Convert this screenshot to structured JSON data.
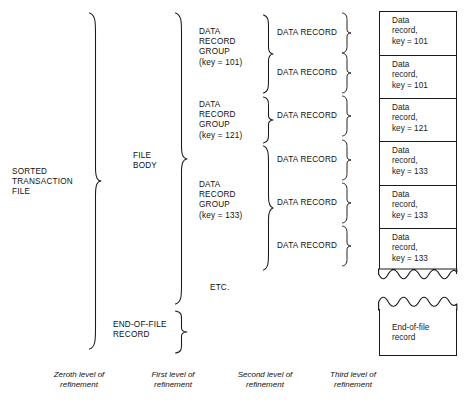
{
  "diagram": {
    "levels": [
      {
        "id": "level0",
        "label": "Zeroth level of\nrefinement"
      },
      {
        "id": "level1",
        "label": "First level of\nrefinement"
      },
      {
        "id": "level2",
        "label": "Second level of\nrefinement"
      },
      {
        "id": "level3",
        "label": "Third level of\nrefinement"
      }
    ],
    "level0": {
      "label": "SORTED\nTRANSACTION\nFILE"
    },
    "level1": {
      "items": [
        {
          "label": "FILE\nBODY"
        },
        {
          "label": "END-OF-FILE\nRECORD"
        }
      ]
    },
    "level2": {
      "groups": [
        {
          "label": "DATA\nRECORD\nGROUP\n(key = 101)",
          "key": "101",
          "record_count": 2
        },
        {
          "label": "DATA\nRECORD\nGROUP\n(key = 121)",
          "key": "121",
          "record_count": 1
        },
        {
          "label": "DATA\nRECORD\nGROUP\n(key = 133)",
          "key": "133",
          "record_count": 3
        }
      ],
      "etc_label": "ETC."
    },
    "level3": {
      "records": [
        {
          "label": "DATA RECORD"
        },
        {
          "label": "DATA RECORD"
        },
        {
          "label": "DATA RECORD"
        },
        {
          "label": "DATA RECORD"
        },
        {
          "label": "DATA RECORD"
        },
        {
          "label": "DATA RECORD"
        }
      ]
    },
    "file_layout": {
      "records": [
        {
          "label": "Data\nrecord,\nkey = 101"
        },
        {
          "label": "Data\nrecord,\nkey = 101"
        },
        {
          "label": "Data\nrecord,\nkey = 121"
        },
        {
          "label": "Data\nrecord,\nkey = 133"
        },
        {
          "label": "Data\nrecord,\nkey = 133"
        },
        {
          "label": "Data\nrecord,\nkey = 133"
        }
      ],
      "eof_record": {
        "label": "End-of-file\nrecord"
      }
    },
    "colors": {
      "ink": "#1a1a1a",
      "paper": "#ffffff"
    }
  }
}
